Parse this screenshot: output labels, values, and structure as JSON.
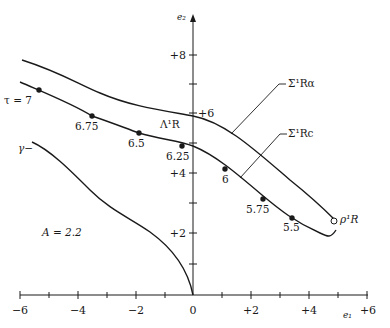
{
  "figure": {
    "parameter_label": "A = 2.2",
    "axes": {
      "x_label": "e₁",
      "y_label": "e₂",
      "x_ticks": [
        "−6",
        "−4",
        "−2",
        "0",
        "+2",
        "+4",
        "+6"
      ],
      "y_ticks": [
        "+2",
        "+4",
        "+6",
        "+8"
      ]
    },
    "curves": {
      "sigma_ra": "Σ¹Rα",
      "sigma_rc": "Σ¹Rc",
      "lambda": "Λ¹R",
      "gamma": "γ−",
      "rho": "ρ¹R"
    },
    "tau_points": [
      {
        "label": "τ = 7"
      },
      {
        "label": "6.75"
      },
      {
        "label": "6.5"
      },
      {
        "label": "6.25"
      },
      {
        "label": "6"
      },
      {
        "label": "5.75"
      },
      {
        "label": "5.5"
      }
    ]
  }
}
